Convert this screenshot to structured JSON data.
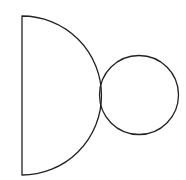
{
  "diagram": {
    "width": 186,
    "height": 180,
    "background": "#ffffff",
    "stroke_color": "#222222",
    "stroke_width": 1.3,
    "shapes": [
      {
        "name": "semicircle",
        "type": "semicircle",
        "flat_edge_x": 22,
        "top_y": 16,
        "bottom_y": 175,
        "center": [
          22,
          95.5
        ],
        "radius": 79.5,
        "orientation": "opens-right"
      },
      {
        "name": "circle",
        "type": "circle",
        "center": [
          139,
          95
        ],
        "radius": 39.5
      }
    ],
    "relation": "circle tangent to semicircle arc at its rightmost point"
  }
}
